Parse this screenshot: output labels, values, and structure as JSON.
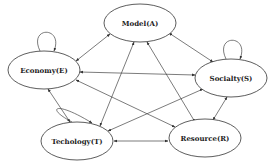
{
  "diagram": {
    "type": "directed-graph",
    "nodes": [
      {
        "id": "A",
        "label": "Model(A)",
        "cx": 140,
        "cy": 23,
        "rx": 36,
        "ry": 19,
        "self_loop": false
      },
      {
        "id": "E",
        "label": "Economy(E)",
        "cx": 44,
        "cy": 70,
        "rx": 36,
        "ry": 19,
        "self_loop": true
      },
      {
        "id": "S",
        "label": "Socialty(S)",
        "cx": 231,
        "cy": 78,
        "rx": 36,
        "ry": 19,
        "self_loop": true
      },
      {
        "id": "T",
        "label": "Techology(T)",
        "cx": 77,
        "cy": 141,
        "rx": 36,
        "ry": 19,
        "self_loop": true
      },
      {
        "id": "R",
        "label": "Resource(R)",
        "cx": 205,
        "cy": 138,
        "rx": 36,
        "ry": 19,
        "self_loop": false
      }
    ],
    "edges": [
      {
        "from": "A",
        "to": "E",
        "bidirectional": true
      },
      {
        "from": "A",
        "to": "S",
        "bidirectional": true
      },
      {
        "from": "A",
        "to": "T",
        "bidirectional": true
      },
      {
        "from": "A",
        "to": "R",
        "bidirectional": true
      },
      {
        "from": "E",
        "to": "S",
        "bidirectional": true
      },
      {
        "from": "E",
        "to": "T",
        "bidirectional": true
      },
      {
        "from": "R",
        "to": "E",
        "bidirectional": true
      },
      {
        "from": "S",
        "to": "T",
        "bidirectional": true
      },
      {
        "from": "S",
        "to": "R",
        "bidirectional": true
      },
      {
        "from": "T",
        "to": "R",
        "bidirectional": true
      }
    ]
  }
}
